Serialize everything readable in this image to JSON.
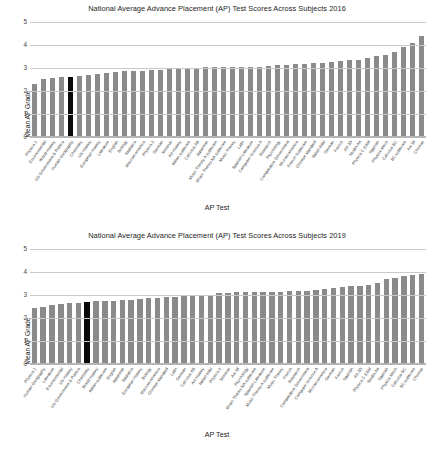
{
  "chart_data": [
    {
      "type": "bar",
      "title": "National Average Advance Placement (AP) Test Scores Across Subjects 2016",
      "xlabel": "AP Test",
      "ylabel": "Mean AP Grade",
      "ylim": [
        0,
        5
      ],
      "yticks": [
        0,
        1,
        2,
        3,
        4,
        5
      ],
      "grid": true,
      "legend": "none",
      "bar_color": "#8a8a8a",
      "highlight_color": "#0a0a0a",
      "highlight_index": 4,
      "categories": [
        "Physics 1",
        "Environmental",
        "World History",
        "US Government & Politics",
        "Human Geography",
        "Chemistry",
        "US History",
        "European History",
        "Literature",
        "English",
        "Biology",
        "Statistics",
        "Macroeconomics",
        "Physics 2",
        "German",
        "Seminar",
        "Art History",
        "Italian subscore",
        "Calculus AB",
        "Japanese",
        "Music Theory A subscore",
        "Music Theory NA subscore",
        "Music Theory",
        "Latin",
        "Spanish Literature",
        "Computer Science A",
        "Research",
        "Psychology",
        "Comparative Government",
        "Microeconomics",
        "French Subscore",
        "Chinese standard",
        "Italian total",
        "German",
        "French",
        "Art 2D",
        "Studio Art",
        "Physics C E&M",
        "Spanish",
        "Physics Mech",
        "Calculus BC",
        "BC subscore",
        "Art 3d",
        "Chinese"
      ],
      "values": [
        2.31,
        2.52,
        2.57,
        2.62,
        2.63,
        2.67,
        2.68,
        2.72,
        2.78,
        2.84,
        2.86,
        2.88,
        2.89,
        2.9,
        2.91,
        2.94,
        2.98,
        3.0,
        3.02,
        3.03,
        3.04,
        3.05,
        3.06,
        3.05,
        3.05,
        3.05,
        3.1,
        3.12,
        3.15,
        3.16,
        3.18,
        3.2,
        3.22,
        3.27,
        3.3,
        3.33,
        3.35,
        3.44,
        3.52,
        3.55,
        3.7,
        3.9,
        4.1,
        4.4
      ]
    },
    {
      "type": "bar",
      "title": "National Average Advance Placement (AP) Test Scores Across Subjects 2019",
      "xlabel": "AP Test",
      "ylabel": "Mean AP Grade",
      "ylim": [
        0,
        5
      ],
      "yticks": [
        0,
        1,
        2,
        3,
        4,
        5
      ],
      "grid": true,
      "legend": "none",
      "bar_color": "#8a8a8a",
      "highlight_color": "#0a0a0a",
      "highlight_index": 6,
      "categories": [
        "Physics 1",
        "Human Geography",
        "Literature",
        "Environmental",
        "US History",
        "US Government & Politics",
        "Chemistry",
        "World History",
        "Italian subscore",
        "English",
        "Japanese",
        "Statistics",
        "European History",
        "Biology",
        "Macroeconomics",
        "Chinese standard",
        "Latin",
        "German",
        "Calculus AB",
        "Art History",
        "Italian total",
        "Physics 2",
        "Seminar",
        "Art 3d",
        "Psychology",
        "Music Theory NA subscore",
        "Spanish Literature",
        "Music Theory A subscore",
        "Music Theory",
        "French",
        "Research",
        "Comparative Government",
        "Computer Science A",
        "Microeconomics",
        "German",
        "French",
        "Spanish",
        "Art 2D",
        "Physics C E&M",
        "Studio Art",
        "Spanish",
        "Physics Mech",
        "Calculus BC",
        "BC subscore",
        "Chinese"
      ],
      "values": [
        2.44,
        2.48,
        2.57,
        2.63,
        2.65,
        2.66,
        2.7,
        2.72,
        2.73,
        2.75,
        2.78,
        2.8,
        2.84,
        2.86,
        2.89,
        2.92,
        2.93,
        2.94,
        2.96,
        2.96,
        3.02,
        3.07,
        3.09,
        3.11,
        3.13,
        3.14,
        3.14,
        3.15,
        3.15,
        3.16,
        3.17,
        3.18,
        3.21,
        3.25,
        3.3,
        3.34,
        3.38,
        3.4,
        3.44,
        3.52,
        3.68,
        3.74,
        3.82,
        3.88,
        3.93
      ]
    }
  ]
}
